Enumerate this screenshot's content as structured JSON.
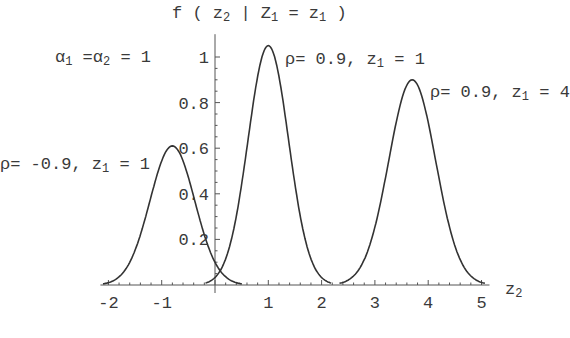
{
  "chart_data": {
    "type": "line",
    "ylabel": "f ( z₂ | Z₁ = z₁ )",
    "xlabel": "z₂",
    "xlim": [
      -2,
      5
    ],
    "ylim": [
      0,
      1.05
    ],
    "x_ticks": [
      -2,
      -1,
      1,
      2,
      3,
      4,
      5
    ],
    "y_ticks": [
      0.2,
      0.4,
      0.6,
      0.8,
      1
    ],
    "y_tick_labels": [
      "0.2",
      "0.4",
      "0.6",
      "0.8",
      "1"
    ],
    "x_tick_labels": [
      "-2",
      "-1",
      "1",
      "2",
      "3",
      "4",
      "5"
    ],
    "grid": false,
    "annotation_params": "α₁ = α₂ = 1",
    "series": [
      {
        "name": "ρ=-0.9, z₁=1",
        "peak_x": -0.8,
        "peak_y": 0.61,
        "sigma": 0.42
      },
      {
        "name": "ρ=0.9, z₁=1",
        "peak_x": 1.0,
        "peak_y": 1.05,
        "sigma": 0.38
      },
      {
        "name": "ρ=0.9, z₁=4",
        "peak_x": 3.7,
        "peak_y": 0.9,
        "sigma": 0.44
      }
    ],
    "line_color": "#333333"
  },
  "labels": {
    "ylabel_f": "f ( z",
    "ylabel_sub2": "2",
    "ylabel_mid": " | Z",
    "ylabel_sub1": "1",
    "ylabel_eq": " = z",
    "ylabel_sub1b": "1",
    "ylabel_end": " )",
    "alpha_a": "α",
    "alpha_sub1": "1",
    "alpha_mid": " =α",
    "alpha_sub2": "2",
    "alpha_end": " = 1",
    "s1_pre": "ρ= -0.9, z",
    "s1_sub": "1",
    "s1_post": " = 1",
    "s2_pre": "ρ= 0.9, z",
    "s2_sub": "1",
    "s2_post": " = 1",
    "s3_pre": "ρ= 0.9, z",
    "s3_sub": "1",
    "s3_post": " = 4",
    "xaxis_z": "z",
    "xaxis_sub": "2"
  }
}
